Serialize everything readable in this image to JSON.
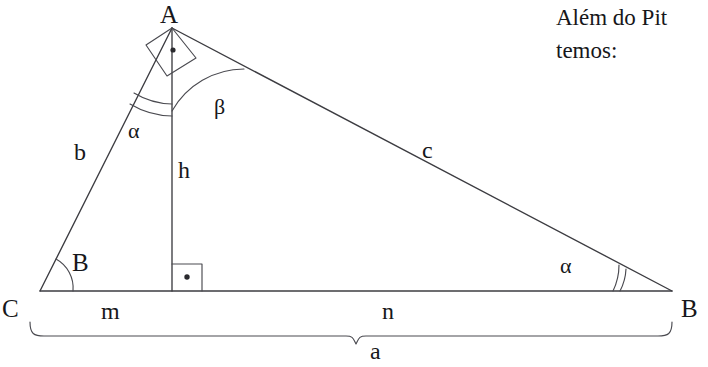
{
  "figure": {
    "kind": "right-triangle-with-altitude",
    "vertices": [
      {
        "name": "A",
        "label": "A",
        "x": 172,
        "y": 28
      },
      {
        "name": "B",
        "label": "B",
        "x": 672,
        "y": 291
      },
      {
        "name": "C",
        "label": "C",
        "x": 40,
        "y": 291
      }
    ],
    "sides": [
      {
        "name": "b",
        "label": "b",
        "from": "C",
        "to": "A"
      },
      {
        "name": "c",
        "label": "c",
        "from": "A",
        "to": "B"
      },
      {
        "name": "a",
        "label": "a",
        "from": "C",
        "to": "B"
      }
    ],
    "altitude": {
      "name": "h",
      "label": "h",
      "foot_x": 172,
      "foot_y": 291
    },
    "segments": [
      {
        "name": "m",
        "label": "m",
        "from": "C",
        "to": "H"
      },
      {
        "name": "n",
        "label": "n",
        "from": "H",
        "to": "B"
      }
    ],
    "angles": [
      {
        "name": "alpha-apex",
        "label": "α",
        "at": "A",
        "marks": 2
      },
      {
        "name": "beta-apex",
        "label": "β",
        "at": "A",
        "marks": 1
      },
      {
        "name": "alpha-at-b",
        "label": "α",
        "at": "B",
        "marks": 2
      },
      {
        "name": "angle-b-at-c",
        "label": "B",
        "at": "C",
        "marks": 1
      }
    ],
    "right_angles": [
      {
        "name": "right-angle-at-apex",
        "at": "A"
      },
      {
        "name": "right-angle-at-altitude-foot",
        "at": "H"
      }
    ],
    "brace": {
      "name": "base-brace",
      "label": "a"
    }
  },
  "labels": {
    "vertex_a": "A",
    "vertex_b": "B",
    "vertex_c": "C",
    "side_b": "b",
    "side_c": "c",
    "side_a": "a",
    "altitude_h": "h",
    "segment_m": "m",
    "segment_n": "n",
    "alpha_apex": "α",
    "beta_apex": "β",
    "alpha_at_b": "α",
    "angle_b_at_c": "B"
  },
  "text": {
    "line1": "Além do Pit",
    "line2": "temos:"
  },
  "colors": {
    "background": "#ffffff",
    "stroke": "#3c3c41",
    "text": "#17171a"
  }
}
